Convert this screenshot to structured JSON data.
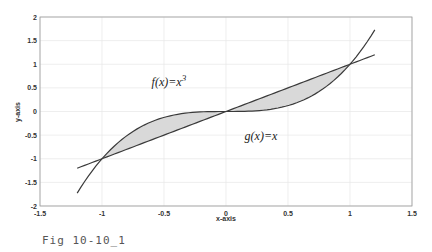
{
  "chart_data": {
    "type": "line",
    "title": "",
    "xlabel": "x-axis",
    "ylabel": "y-axis",
    "xlim": [
      -1.5,
      1.5
    ],
    "ylim": [
      -2,
      2
    ],
    "grid": true,
    "xticks": [
      "-1.5",
      "-1",
      "-0.5",
      "0",
      "0.5",
      "1",
      "1.5"
    ],
    "yticks": [
      "2",
      "1.5",
      "1",
      "0.5",
      "0",
      "-0.5",
      "-1",
      "-1.5",
      "-2"
    ],
    "series": [
      {
        "name": "f(x)=x^3",
        "function": "x^3",
        "x_range": [
          -1.2,
          1.2
        ]
      },
      {
        "name": "g(x)=x",
        "function": "x",
        "x_range": [
          -1.2,
          1.2
        ]
      }
    ],
    "shaded_regions": [
      {
        "between": [
          "f",
          "g"
        ],
        "x_range": [
          -1,
          0
        ]
      },
      {
        "between": [
          "f",
          "g"
        ],
        "x_range": [
          0,
          1
        ]
      }
    ],
    "annotations": [
      {
        "text": "f(x)=x",
        "superscript": "3",
        "x": -0.6,
        "y": 0.55
      },
      {
        "text": "g(x)=x",
        "x": 0.15,
        "y": -0.6
      }
    ]
  },
  "caption": "Fig 10-10_1"
}
